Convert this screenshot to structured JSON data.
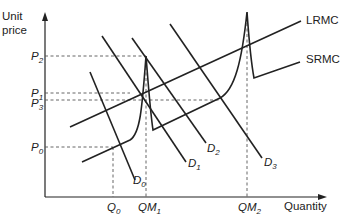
{
  "diagram": {
    "type": "economics-marginal-cost-pricing",
    "axes": {
      "y_label_line1": "Unit",
      "y_label_line2": "price",
      "x_label": "Quantity"
    },
    "price_levels": [
      {
        "id": "P2",
        "base": "P",
        "sub": "2"
      },
      {
        "id": "P1",
        "base": "P",
        "sub": "1"
      },
      {
        "id": "P3",
        "base": "P",
        "sub": "3"
      },
      {
        "id": "P0",
        "base": "P",
        "sub": "0"
      }
    ],
    "quantity_levels": [
      {
        "id": "Q0",
        "base": "Q",
        "sub": "0"
      },
      {
        "id": "QM1",
        "base": "QM",
        "sub": "1"
      },
      {
        "id": "QM2",
        "base": "QM",
        "sub": "2"
      }
    ],
    "demand_curves": [
      {
        "id": "D0",
        "base": "D",
        "sub": "0"
      },
      {
        "id": "D1",
        "base": "D",
        "sub": "1"
      },
      {
        "id": "D2",
        "base": "D",
        "sub": "2"
      },
      {
        "id": "D3",
        "base": "D",
        "sub": "3"
      }
    ],
    "cost_curves": {
      "lrmc": "LRMC",
      "srmc": "SRMC"
    },
    "colors": {
      "line": "#222222",
      "dashed": "#555555",
      "background": "#ffffff"
    }
  }
}
